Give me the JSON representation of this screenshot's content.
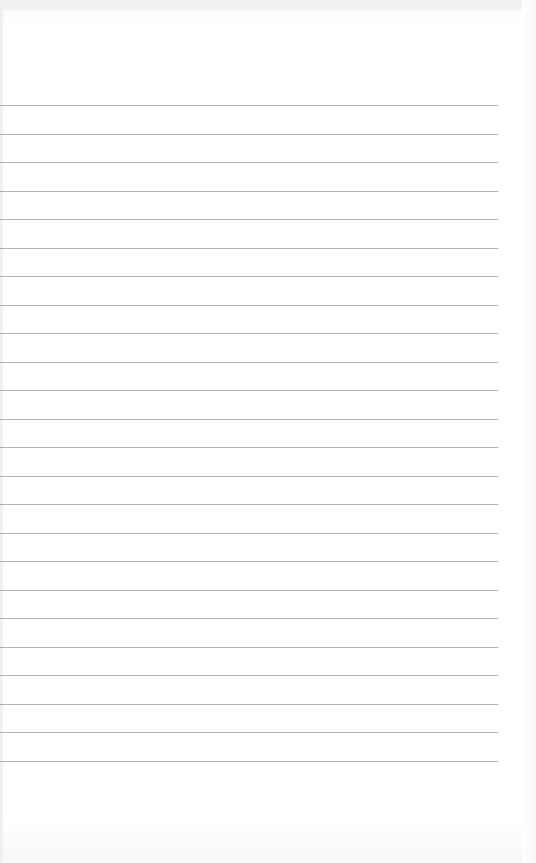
{
  "page": {
    "type": "lined-paper",
    "background_color": "#ffffff",
    "rule_color": "#9a9a9a",
    "rule_count": 24,
    "first_rule_y": 105,
    "rule_spacing": 28.5,
    "rule_right_x": 498,
    "text": ""
  }
}
